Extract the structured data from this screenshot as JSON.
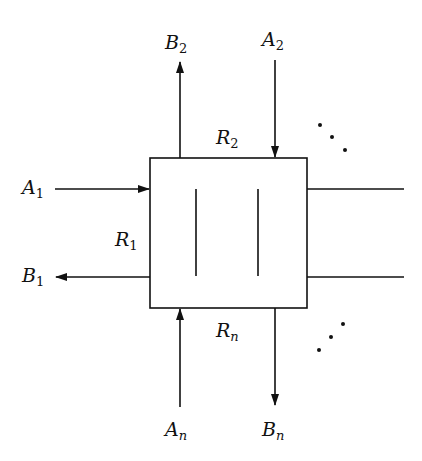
{
  "diagram": {
    "type": "node-with-ports",
    "node": {
      "name": "central-box",
      "inner_lines": 2
    },
    "labels": {
      "A1": {
        "base": "A",
        "sub": "1"
      },
      "B1": {
        "base": "B",
        "sub": "1"
      },
      "R1": {
        "base": "R",
        "sub": "1"
      },
      "A2": {
        "base": "A",
        "sub": "2"
      },
      "B2": {
        "base": "B",
        "sub": "2"
      },
      "R2": {
        "base": "R",
        "sub": "2"
      },
      "An": {
        "base": "A",
        "sub": "n"
      },
      "Bn": {
        "base": "B",
        "sub": "n"
      },
      "Rn": {
        "base": "R",
        "sub": "n"
      }
    },
    "edges": [
      {
        "from": "A1",
        "to": "box",
        "side": "left",
        "direction": "in"
      },
      {
        "from": "box",
        "to": "B1",
        "side": "left",
        "direction": "out"
      },
      {
        "from": "A2",
        "to": "box",
        "side": "top",
        "direction": "in"
      },
      {
        "from": "box",
        "to": "B2",
        "side": "top",
        "direction": "out"
      },
      {
        "from": "An",
        "to": "box",
        "side": "bottom",
        "direction": "in"
      },
      {
        "from": "box",
        "to": "Bn",
        "side": "bottom",
        "direction": "out"
      },
      {
        "from": "box",
        "to": "right-1",
        "side": "right",
        "direction": "none"
      },
      {
        "from": "box",
        "to": "right-2",
        "side": "right",
        "direction": "none"
      }
    ],
    "ellipses": [
      "top-right-diagonal",
      "bottom-right-diagonal"
    ],
    "stroke_color": "#111111"
  }
}
